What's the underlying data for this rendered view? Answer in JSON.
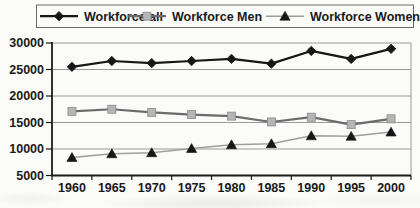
{
  "chart_data": {
    "type": "line",
    "title": "",
    "xlabel": "",
    "ylabel": "",
    "categories": [
      "1960",
      "1965",
      "1970",
      "1975",
      "1980",
      "1985",
      "1990",
      "1995",
      "2000"
    ],
    "series": [
      {
        "name": "Workforce all",
        "marker": "diamond",
        "line_color": "#161616",
        "marker_fill": "#161616",
        "marker_stroke": "#161616",
        "line_width": 2.2,
        "values": [
          25500,
          26600,
          26200,
          26600,
          27000,
          26100,
          28500,
          27000,
          28900
        ]
      },
      {
        "name": "Workforce Men",
        "marker": "square",
        "line_color": "#6b6b6b",
        "marker_fill": "#b5b5b5",
        "marker_stroke": "#8a8a8a",
        "line_width": 2.2,
        "values": [
          17100,
          17500,
          16900,
          16500,
          16200,
          15100,
          16000,
          14600,
          15700
        ]
      },
      {
        "name": "Workforce Women",
        "marker": "triangle",
        "line_color": "#9e9e9e",
        "marker_fill": "#161616",
        "marker_stroke": "#161616",
        "line_width": 1.4,
        "values": [
          8400,
          9100,
          9300,
          10100,
          10800,
          11000,
          12500,
          12400,
          13200
        ]
      }
    ],
    "ylim": [
      5000,
      30000
    ],
    "y_ticks": [
      5000,
      10000,
      15000,
      20000,
      25000,
      30000
    ],
    "y_tick_labels": [
      "5000",
      "10000",
      "15000",
      "20000",
      "25000",
      "30000"
    ],
    "grid": true,
    "legend_position": "top",
    "colors": {
      "background": "#fbfbf9",
      "axis": "#1a1a1a",
      "gridline": "#9a9a9a",
      "plot_right_border": "#9a9a9a",
      "legend_border": "#6a6a6a",
      "text": "#1a1a1a"
    }
  }
}
